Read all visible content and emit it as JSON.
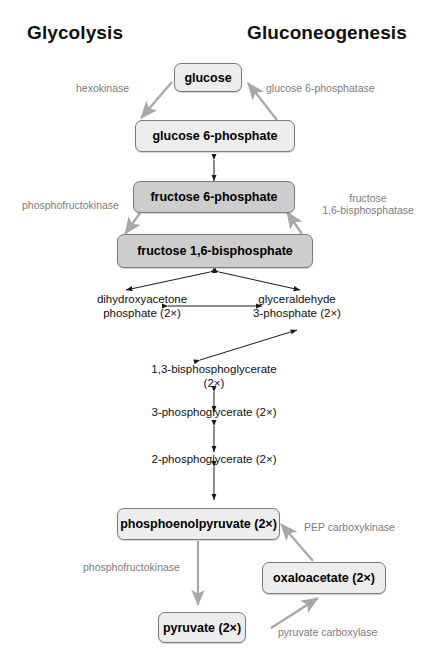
{
  "figure": {
    "title_left": "Glycolysis",
    "title_right": "Gluconeogenesis",
    "background": "#ffffff",
    "arrow_gray": "#a8a8a8",
    "arrow_black": "#1a1a1a"
  },
  "nodes": [
    {
      "id": "glucose",
      "label": "glucose",
      "fill": "#ededed",
      "boxed": true
    },
    {
      "id": "g6p",
      "label": "glucose 6-phosphate",
      "fill": "#ededed",
      "boxed": true
    },
    {
      "id": "f6p",
      "label": "fructose 6-phosphate",
      "fill": "#cdcdcd",
      "boxed": true
    },
    {
      "id": "fbp",
      "label": "fructose 1,6-bisphosphate",
      "fill": "#cdcdcd",
      "boxed": true
    },
    {
      "id": "pep",
      "label": "phosphoenolpyruvate (2×)",
      "fill": "#ededed",
      "boxed": true
    },
    {
      "id": "oaa",
      "label": "oxaloacetate (2×)",
      "fill": "#ededed",
      "boxed": true
    },
    {
      "id": "pyruvate",
      "label": "pyruvate (2×)",
      "fill": "#ededed",
      "boxed": true
    }
  ],
  "intermediates": {
    "dhap_line1": "dihydroxyacetone",
    "dhap_line2": "phosphate (2×)",
    "gap_line1": "glyceraldehyde",
    "gap_line2": "3-phosphate (2×)",
    "bpg_line1": "1,3-bisphosphoglycerate",
    "bpg_line2": "(2×)",
    "pg3": "3-phosphoglycerate (2×)",
    "pg2": "2-phosphoglycerate (2×)"
  },
  "enzymes": {
    "hexokinase": "hexokinase",
    "glucose_6_phosphatase": "glucose 6-phosphatase",
    "phosphofructokinase_upper": "phosphofructokinase",
    "fructose_bisphosphatase_line1": "fructose",
    "fructose_bisphosphatase_line2": "1,6-bisphosphatase",
    "phosphofructokinase_lower": "phosphofructokinase",
    "pep_carboxykinase": "PEP carboxykinase",
    "pyruvate_carboxylase": "pyruvate carboxylase"
  }
}
